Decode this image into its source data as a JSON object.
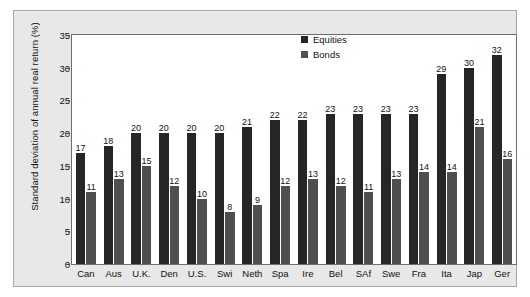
{
  "chart_data": {
    "type": "bar",
    "title": "",
    "xlabel": "",
    "ylabel": "Standard deviation of annual real return (%)",
    "ylim": [
      0,
      35
    ],
    "yticks": [
      0,
      5,
      10,
      15,
      20,
      25,
      30,
      35
    ],
    "ytick_labels": [
      "0",
      "5",
      "10",
      "15",
      "20",
      "25",
      "30",
      "35"
    ],
    "grid": false,
    "legend_position": "top-right",
    "categories": [
      "Can",
      "Aus",
      "U.K.",
      "Den",
      "U.S.",
      "Swi",
      "Neth",
      "Spa",
      "Ire",
      "Bel",
      "SAf",
      "Swe",
      "Fra",
      "Ita",
      "Jap",
      "Ger"
    ],
    "series": [
      {
        "name": "Equities",
        "color": "#262626",
        "values": [
          17,
          18,
          20,
          20,
          20,
          20,
          21,
          22,
          22,
          23,
          23,
          23,
          23,
          29,
          30,
          32
        ],
        "labels": [
          "17",
          "18",
          "20",
          "20",
          "20",
          "20",
          "21",
          "22",
          "22",
          "23",
          "23",
          "23",
          "23",
          "29",
          "30",
          "32"
        ]
      },
      {
        "name": "Bonds",
        "color": "#4f4f4f",
        "values": [
          11,
          13,
          15,
          12,
          10,
          8,
          9,
          12,
          13,
          12,
          11,
          13,
          14,
          14,
          21,
          16
        ],
        "labels": [
          "11",
          "13",
          "15",
          "12",
          "10",
          "8",
          "9",
          "12",
          "13",
          "12",
          "11",
          "13",
          "14",
          "14",
          "21",
          "16"
        ]
      }
    ]
  },
  "legend": {
    "items": [
      {
        "label": "Equities",
        "color": "#262626"
      },
      {
        "label": "Bonds",
        "color": "#4f4f4f"
      }
    ]
  },
  "colors": {
    "panel_background": "#e8e8e8",
    "plot_background": "#ffffff",
    "axis": "#6e6e6e",
    "text": "#111111"
  }
}
